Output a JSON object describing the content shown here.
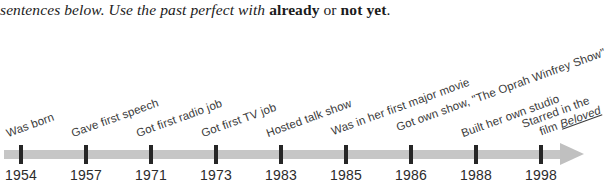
{
  "instruction": {
    "text_part1": "sentences below. Use the past perfect with ",
    "bold1": "already",
    "mid": " or ",
    "bold2": "not yet",
    "end": "."
  },
  "timeline": {
    "title": "Oprah Winfrey life events timeline",
    "axis_color": "#c6c6c6",
    "tick_color": "#262626",
    "text_color": "#3a3a3a",
    "arrow_direction": "right",
    "events": [
      {
        "year": "1954",
        "label": "Was born",
        "label_line2": ""
      },
      {
        "year": "1957",
        "label": "Gave first speech",
        "label_line2": ""
      },
      {
        "year": "1971",
        "label": "Got first radio job",
        "label_line2": ""
      },
      {
        "year": "1973",
        "label": "Got first TV job",
        "label_line2": ""
      },
      {
        "year": "1983",
        "label": "Hosted talk show",
        "label_line2": ""
      },
      {
        "year": "1985",
        "label": "Was in her first major movie",
        "label_line2": ""
      },
      {
        "year": "1986",
        "label": "Got own show, \"The Oprah Winfrey Show\"",
        "label_line2": ""
      },
      {
        "year": "1988",
        "label": "Built her own studio",
        "label_line2": ""
      },
      {
        "year": "1998",
        "label": "Starred in the",
        "label_line2": "film Beloved",
        "label_line2_italic": "Beloved"
      }
    ]
  }
}
